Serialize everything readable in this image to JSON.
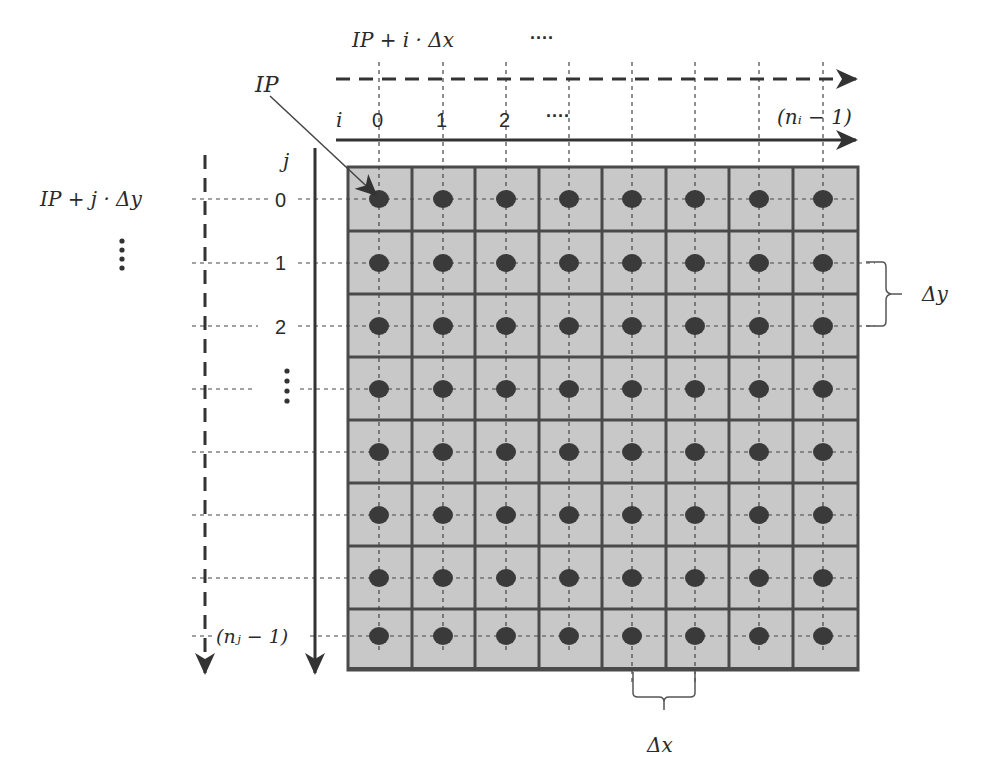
{
  "diagram": {
    "type": "grid-indexing-diagram",
    "grid": {
      "rows": 8,
      "cols": 8,
      "cell_fill": "#c8c8c8",
      "border_color": "#4a4a4a",
      "dot_color": "#3a3a3a",
      "dot_centers_x": [
        379,
        443,
        506,
        569,
        632,
        695,
        759,
        823
      ],
      "dot_centers_y": [
        199,
        263,
        326,
        389,
        452,
        515,
        578,
        636
      ]
    },
    "labels": {
      "ip_label": "IP",
      "x_position_formula": "IP + i · Δx",
      "x_position_ellipsis": "····",
      "y_position_formula": "IP +  j · Δy",
      "y_position_ellipsis": "⋮",
      "i_axis_label": "i",
      "j_axis_label": "j",
      "delta_x": "Δx",
      "delta_y": "Δy"
    },
    "i_axis": {
      "ticks": [
        "0",
        "1",
        "2",
        "····"
      ],
      "last_tick": "(nᵢ − 1)"
    },
    "j_axis": {
      "ticks": [
        "0",
        "1",
        "2",
        "⋮"
      ],
      "last_tick": "(nⱼ − 1)"
    }
  }
}
